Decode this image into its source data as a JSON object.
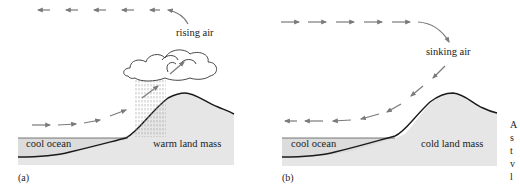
{
  "figure": {
    "colors": {
      "land_fill": "#e6e6e6",
      "ocean_fill": "#dcdcdc",
      "ground_line": "#1a1a1a",
      "arrow": "#7a7a7a",
      "cloud_stroke": "#333333",
      "rain": "#9a9a9a"
    },
    "panels": [
      {
        "id": "a",
        "caption": "(a)",
        "air_label": "rising air",
        "ocean_label": "cool ocean",
        "land_label": "warm land mass",
        "upper_flow_direction": "left",
        "lower_flow_direction": "right-up",
        "has_cloud": true,
        "has_rain": true
      },
      {
        "id": "b",
        "caption": "(b)",
        "air_label": "sinking air",
        "ocean_label": "cool ocean",
        "land_label": "cold land mass",
        "upper_flow_direction": "right",
        "lower_flow_direction": "left-down",
        "has_cloud": false,
        "has_rain": false
      }
    ],
    "side_text_fragments": [
      "A",
      "s",
      "t",
      "v",
      "l"
    ]
  }
}
